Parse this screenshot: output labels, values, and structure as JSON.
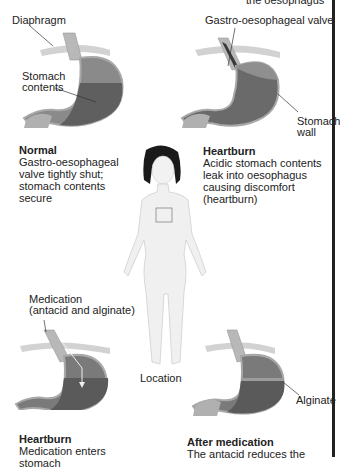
{
  "top_cut_text": "the oesophagus",
  "panels": {
    "normal": {
      "labels": {
        "diaphragm": "Diaphragm",
        "stomach_contents_1": "Stomach",
        "stomach_contents_2": "contents"
      },
      "title": "Normal",
      "body_lines": [
        "Gastro-oesophageal",
        "valve tightly shut;",
        "stomach contents",
        "secure"
      ]
    },
    "heartburn_top": {
      "labels": {
        "valve": "Gastro-oesophageal valve",
        "wall_1": "Stomach",
        "wall_2": "wall"
      },
      "title": "Heartburn",
      "body_lines": [
        "Acidic stomach contents",
        "leak into oesophagus",
        "causing discomfort",
        "(heartburn)"
      ]
    },
    "location": {
      "label": "Location"
    },
    "heartburn_medication": {
      "labels": {
        "medication_1": "Medication",
        "medication_2": "(antacid and alginate)"
      },
      "title": "Heartburn",
      "body_lines": [
        "Medication enters stomach"
      ]
    },
    "after_medication": {
      "labels": {
        "alginate": "Alginate"
      },
      "title": "After medication",
      "body_lines": [
        "The antacid reduces the"
      ]
    }
  },
  "colors": {
    "stomach_wall": "#9a9a9a",
    "stomach_upper": "#7a7a7a",
    "stomach_contents": "#5f5f5f",
    "diaphragm": "#d2d2d2",
    "skin": "#f0f0f0",
    "hair": "#1a1a1a",
    "text": "#222222"
  }
}
